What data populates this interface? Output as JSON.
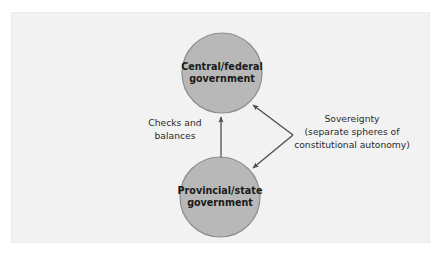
{
  "figure": {
    "type": "concept-diagram",
    "panel": {
      "background_color": "#f2f2f2",
      "border_color": "#ebebeb"
    },
    "style": {
      "node_fill": "#b8b8b8",
      "node_stroke": "#8c8c8c",
      "connector_color": "#4d4d4d",
      "label_color": "#2b2b2b",
      "node_text_color": "#1a1a1a"
    },
    "nodes": [
      {
        "id": "central",
        "shape": "circle",
        "label_line1": "Central/federal",
        "label_line2": "government",
        "cx": 222,
        "cy": 73,
        "r": 40
      },
      {
        "id": "provincial",
        "shape": "circle",
        "label_line1": "Provincial/state",
        "label_line2": "government",
        "cx": 220,
        "cy": 197,
        "r": 40
      }
    ],
    "connectors": [
      {
        "id": "checks-and-balances",
        "style": "double-headed-arrow",
        "orientation": "vertical",
        "from": "provincial",
        "to": "central",
        "label_line1": "Checks and",
        "label_line2": "balances"
      },
      {
        "id": "sovereignty",
        "style": "forked-arrows",
        "orientation": "diagonal",
        "from": "label-vertex",
        "to": [
          "central",
          "provincial"
        ],
        "label_line1": "Sovereignty",
        "label_line2": "(separate spheres of",
        "label_line3": "constitutional autonomy)"
      }
    ]
  }
}
